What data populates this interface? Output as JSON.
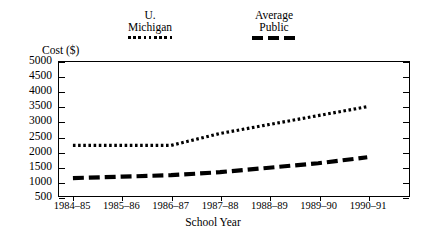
{
  "chart_data": {
    "type": "line",
    "title": "",
    "xlabel": "School Year",
    "ylabel": "Cost ($)",
    "categories": [
      "1984–85",
      "1985–86",
      "1986–87",
      "1987–88",
      "1988–89",
      "1989–90",
      "1990–91"
    ],
    "ylim": [
      500,
      5000
    ],
    "yticks": [
      500,
      1000,
      1500,
      2000,
      2500,
      3000,
      3500,
      4000,
      4500,
      5000
    ],
    "ytick_labels": [
      "500",
      "1000",
      "1500",
      "2000",
      "2500",
      "3000",
      "3500",
      "4000",
      "4500",
      "5000"
    ],
    "grid": false,
    "legend_position": "top",
    "series": [
      {
        "name": "U. Michigan",
        "name_line1": "U.",
        "name_line2": "Michigan",
        "style": "dotted",
        "color": "#000000",
        "values": [
          2200,
          2200,
          2200,
          2600,
          2900,
          3200,
          3500
        ]
      },
      {
        "name": "Average Public",
        "name_line1": "Average",
        "name_line2": "Public",
        "style": "dashed",
        "color": "#000000",
        "values": [
          1100,
          1150,
          1200,
          1300,
          1450,
          1600,
          1800
        ]
      }
    ]
  },
  "legend": {
    "entries": [
      {
        "line1": "U.",
        "line2": "Michigan",
        "swatch": "dotted-line-swatch"
      },
      {
        "line1": "Average",
        "line2": "Public",
        "swatch": "dashed-line-swatch"
      }
    ]
  },
  "axes": {
    "y_title": "Cost ($)",
    "x_title": "School Year"
  }
}
